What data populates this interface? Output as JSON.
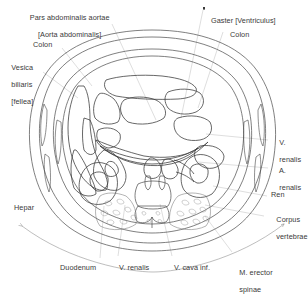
{
  "figure": {
    "type": "anatomical-cross-section",
    "plane": "transverse",
    "orientation": "viewed from below",
    "colors": {
      "background": "#ffffff",
      "outline": "#4a4a4a",
      "organ_stroke": "#3d3d3d",
      "leader_line": "#b9b9b9",
      "bone_stipple": "#8e8e8e",
      "text": "#3a3a3a"
    }
  },
  "labels": {
    "aorta": {
      "line1": "Pars abdominalis aortae",
      "line2": "[Aorta abdominalis]"
    },
    "colon_left": "Colon",
    "vesica": {
      "line1": "Vesica",
      "line2": "biliaris",
      "line3": "[fellea]"
    },
    "gaster": "Gaster [Ventriculus]",
    "colon_right": "Colon",
    "v_renalis_right": {
      "line1": "V.",
      "line2": "renalis"
    },
    "a_renalis_right": {
      "line1": "A.",
      "line2": "renalis"
    },
    "ren": "Ren",
    "corpus_vertebrae": {
      "line1": "Corpus",
      "line2": "vertebrae"
    },
    "hepar": "Hepar",
    "duodenum": "Duodenum",
    "v_renalis_bottom": "V. renalis",
    "v_cava_inf": "V. cava inf.",
    "m_erector_spinae": {
      "line1": "M. erector",
      "line2": "spinae"
    }
  },
  "structures": [
    "body wall",
    "hepar",
    "vesica biliaris",
    "gaster",
    "colon",
    "duodenum",
    "pancreas",
    "aorta abdominalis",
    "vena cava inferior",
    "ren dexter",
    "ren sinister",
    "vena renalis",
    "arteria renalis",
    "corpus vertebrae",
    "musculus erector spinae"
  ]
}
